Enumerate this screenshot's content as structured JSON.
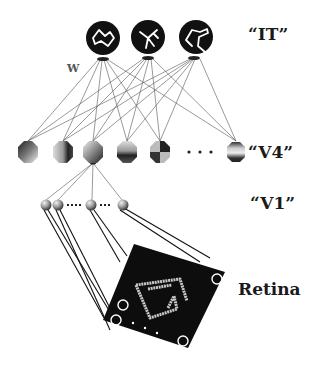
{
  "labels": {
    "it": "“IT”",
    "v4": "“V4”",
    "v1": "“V1”",
    "retina": "Retina",
    "weights": "W"
  },
  "layers": {
    "it": {
      "name": "IT",
      "unit_count": 3,
      "units": [
        "zigzag-shape",
        "branching-shape",
        "curved-shape"
      ]
    },
    "v4": {
      "name": "V4",
      "unit_count_visible": 6,
      "has_ellipsis": true
    },
    "v1": {
      "name": "V1",
      "unit_count_visible": 4,
      "has_ellipsis": true
    },
    "retina": {
      "name": "Retina",
      "stimulus": "arrow-like contour shape",
      "has_ellipsis": true
    }
  },
  "colors": {
    "background": "#ffffff",
    "unit_fill": "#111111",
    "line": "#333333",
    "stimulus": "#cccccc"
  }
}
